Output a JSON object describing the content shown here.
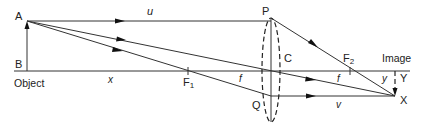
{
  "diagram": {
    "labels": {
      "A": "A",
      "B": "B",
      "object": "Object",
      "P": "P",
      "Q": "Q",
      "C": "C",
      "F1": "F",
      "F1_sub": "1",
      "F2": "F",
      "F2_sub": "2",
      "image": "Image",
      "X": "X",
      "Y": "Y",
      "u": "u",
      "v": "v",
      "x": "x",
      "y": "y",
      "f_left": "f",
      "f_right": "f"
    },
    "colors": {
      "line": "#333333",
      "text": "#222222",
      "background": "#ffffff"
    }
  }
}
